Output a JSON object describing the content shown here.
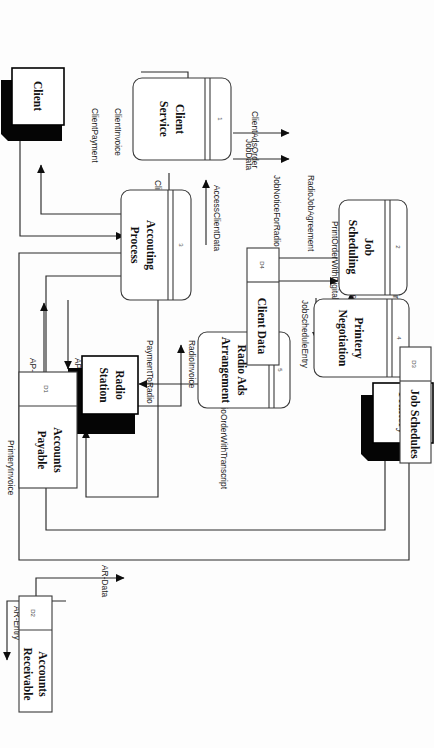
{
  "diagram": {
    "type": "data-flow-diagram",
    "orientation": "rotated-90",
    "colors": {
      "background": "#fdfdfd",
      "stroke": "#2a2a2a",
      "entity_shadow": "#050505",
      "text": "#111111"
    }
  },
  "processes": [
    {
      "id": "1",
      "number": "1",
      "name_line1": "Client",
      "name_line2": "Service"
    },
    {
      "id": "2",
      "number": "2",
      "name_line1": "Job",
      "name_line2": "Scheduling"
    },
    {
      "id": "3",
      "number": "3",
      "name_line1": "Accouting",
      "name_line2": "Process"
    },
    {
      "id": "4",
      "number": "4",
      "name_line1": "Printery",
      "name_line2": "Negotiation"
    },
    {
      "id": "5",
      "number": "5",
      "name_line1": "Radio Ads",
      "name_line2": "Arrangement"
    }
  ],
  "entities": [
    {
      "id": "printery",
      "name": "Printery"
    },
    {
      "id": "radio-station",
      "name_line1": "Radio",
      "name_line2": "Station"
    },
    {
      "id": "client",
      "name": "Client"
    }
  ],
  "datastores": [
    {
      "id": "D1",
      "code": "D1",
      "name_line1": "Accounts",
      "name_line2": "Payable"
    },
    {
      "id": "D2",
      "code": "D2",
      "name_line1": "Accounts",
      "name_line2": "Receivable"
    },
    {
      "id": "D3",
      "code": "D3",
      "name_line1": "Job Schedules",
      "name_line2": ""
    },
    {
      "id": "D4",
      "code": "D4",
      "name_line1": "Client Data",
      "name_line2": ""
    }
  ],
  "flows": [
    {
      "id": "f01",
      "label": "AdvertisingJobOrder",
      "from": "client",
      "to": "1"
    },
    {
      "id": "f02",
      "label": "ClientDataEntry",
      "from": "1",
      "to": "D4"
    },
    {
      "id": "f03",
      "label": "AccessClientData",
      "from": "D4",
      "to": "1"
    },
    {
      "id": "f04",
      "label": "ClientAdsOrder",
      "from": "1",
      "to": "2"
    },
    {
      "id": "f05",
      "label": "JobData",
      "from": "1",
      "to": "2"
    },
    {
      "id": "f06",
      "label": "JobScheduleEntry",
      "from": "2",
      "to": "D3"
    },
    {
      "id": "f07",
      "label": "JobData",
      "from": "D3",
      "to": "2"
    },
    {
      "id": "f08",
      "label": "JobNoticeForPrintery",
      "from": "2",
      "to": "4"
    },
    {
      "id": "f09",
      "label": "PrinteryJobAgreement",
      "from": "4",
      "to": "2"
    },
    {
      "id": "f10",
      "label": "JobNoticeForRadio",
      "from": "2",
      "to": "5"
    },
    {
      "id": "f11",
      "label": "RadioJobAgreement",
      "from": "5",
      "to": "2"
    },
    {
      "id": "f12",
      "label": "PrintOrderWithDigitalDesign",
      "from": "4",
      "to": "printery"
    },
    {
      "id": "f13",
      "label": "RadioOrderWithTranscript",
      "from": "5",
      "to": "radio-station"
    },
    {
      "id": "f14",
      "label": "PrinteryInvoice",
      "from": "printery",
      "to": "3"
    },
    {
      "id": "f15",
      "label": "PaymentToPrintery",
      "from": "3",
      "to": "printery"
    },
    {
      "id": "f16",
      "label": "RadioInvoice",
      "from": "radio-station",
      "to": "3"
    },
    {
      "id": "f17",
      "label": "PaymentToRadio",
      "from": "3",
      "to": "radio-station"
    },
    {
      "id": "f18",
      "label": "ClientInvoice",
      "from": "3",
      "to": "client"
    },
    {
      "id": "f19",
      "label": "ClientPayment",
      "from": "client",
      "to": "3"
    },
    {
      "id": "f20",
      "label": "AR-Entry",
      "from": "3",
      "to": "D2"
    },
    {
      "id": "f21",
      "label": "AR-Data",
      "from": "D2",
      "to": "3"
    },
    {
      "id": "f22",
      "label": "AP-\nEntry",
      "from": "3",
      "to": "D1"
    },
    {
      "id": "f23",
      "label": "AP-\nData",
      "from": "D1",
      "to": "3"
    }
  ],
  "flow_labels": {
    "advertising_job_order": "AdvertisingJobOrder",
    "client_data_entry": "ClientDataEntry",
    "access_client_data": "AccessClientData",
    "client_ads_order": "ClientAdsOrder",
    "job_data_a": "JobData",
    "job_schedule_entry": "JobScheduleEntry",
    "job_data_b": "JobData",
    "job_notice_for_printery": "JobNoticeForPrintery",
    "printery_job_agreement": "PrinteryJobAgreement",
    "job_notice_for_radio": "JobNoticeForRadio",
    "radio_job_agreement": "RadioJobAgreement",
    "print_order_with_digital_design": "PrintOrderWithDigitalDesign",
    "radio_order_with_transcript": "RadioOrderWithTranscript",
    "printery_invoice": "PrinteryInvoice",
    "payment_to_printery": "PaymentToPrintery",
    "radio_invoice": "RadioInvoice",
    "payment_to_radio": "PaymentToRadio",
    "client_invoice": "ClientInvoice",
    "client_payment": "ClientPayment",
    "ar_entry": "AR-Entry",
    "ar_data": "AR-Data",
    "ap_entry_1": "AP-",
    "ap_entry_2": "Entry",
    "ap_data_1": "AP-",
    "ap_data_2": "Data"
  }
}
